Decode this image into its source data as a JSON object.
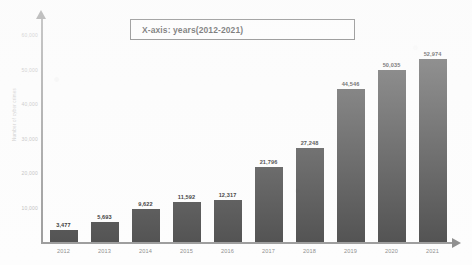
{
  "callout": {
    "label": "X-axis: years(2012-2021)"
  },
  "axis": {
    "y_title": "Number of cyber crimes",
    "y_ticks": [
      "60,000",
      "50,000",
      "40,000",
      "30,000",
      "20,000",
      "10,000"
    ],
    "x_arrow_icon": "arrow-right-icon",
    "y_arrow_icon": "arrow-up-icon"
  },
  "colors": {
    "bar": "#4c4c4c",
    "axis": "#9a9a9a",
    "callout_border": "#5c5c5c",
    "value_label": "#2b2b2b",
    "tick_label": "#8d8d8d",
    "background": "#fdfdfd"
  },
  "chart_data": {
    "type": "bar",
    "title": "X-axis: years(2012-2021)",
    "xlabel": "",
    "ylabel": "Number of cyber crimes",
    "categories": [
      "2012",
      "2013",
      "2014",
      "2015",
      "2016",
      "2017",
      "2018",
      "2019",
      "2020",
      "2021"
    ],
    "values": [
      3477,
      5693,
      9622,
      11592,
      12317,
      21796,
      27248,
      44546,
      50035,
      52974
    ],
    "value_labels": [
      "3,477",
      "5,693",
      "9,622",
      "11,592",
      "12,317",
      "21,796",
      "27,248",
      "44,546",
      "50,035",
      "52,974"
    ],
    "ylim": [
      0,
      65000
    ],
    "ytick_values": [
      60000,
      50000,
      40000,
      30000,
      20000,
      10000
    ],
    "grid": false,
    "legend": false
  }
}
